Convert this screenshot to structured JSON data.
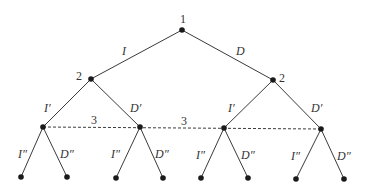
{
  "diagram": {
    "type": "game-tree",
    "players": {
      "root": "1",
      "left_mover": "2",
      "right_mover": "2",
      "info_set_left": "3",
      "info_set_right": "3"
    },
    "actions": {
      "root_left": "I",
      "root_right": "D",
      "l2_left_left": "I′",
      "l2_left_right": "D′",
      "l2_right_left": "I′",
      "l2_right_right": "D′",
      "leaf_labels": [
        {
          "left": "I″",
          "right": "D″"
        },
        {
          "left": "I″",
          "right": "D″"
        },
        {
          "left": "I″",
          "right": "D″"
        },
        {
          "left": "I″",
          "right": "D″"
        }
      ]
    }
  }
}
